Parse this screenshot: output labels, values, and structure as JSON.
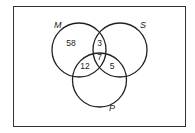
{
  "diagram": {
    "type": "venn",
    "sets": [
      {
        "id": "M",
        "label": "M"
      },
      {
        "id": "S",
        "label": "S"
      },
      {
        "id": "P",
        "label": "P"
      }
    ],
    "regions": {
      "M_only": "58",
      "M_and_S_only": "3",
      "M_and_S_and_P": "7",
      "M_and_P_only": "12",
      "S_and_P_only": "5"
    },
    "colors": {
      "stroke": "#222222",
      "background": "#ffffff"
    }
  }
}
